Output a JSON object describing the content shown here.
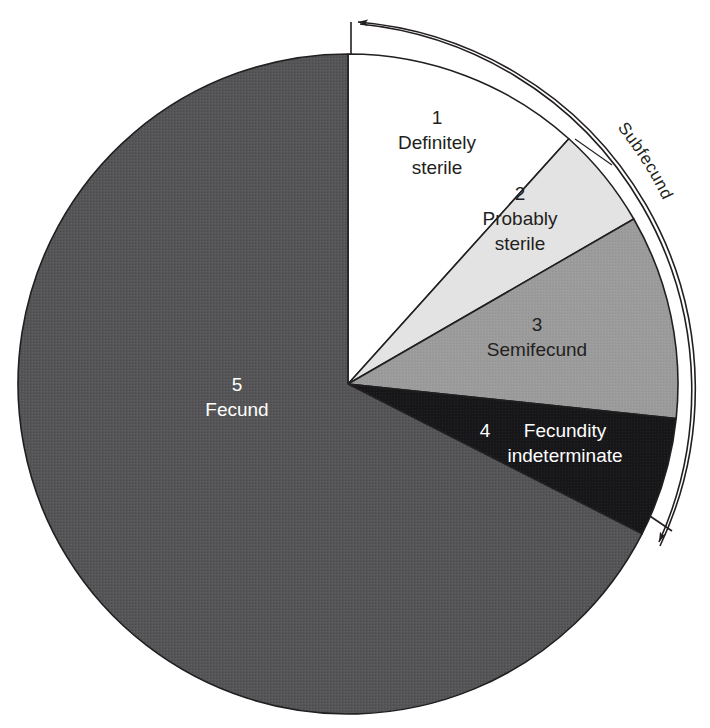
{
  "figure": {
    "type": "pie",
    "background": "#ffffff"
  },
  "bracket": {
    "label": "Subfecund",
    "start_angle_deg": 0,
    "end_angle_deg": 118,
    "start_arrow": "arrowhead-left",
    "end_arrow": "arrowhead-down"
  },
  "chart_data": {
    "type": "pie",
    "title": "",
    "subtitle": "",
    "xlabel": "",
    "ylabel": "",
    "grid": false,
    "legend": "none",
    "start_angle_deg": 0,
    "direction": "clockwise",
    "center": {
      "x": 348,
      "y": 384
    },
    "radius": 330,
    "annotations": [
      {
        "text": "Subfecund",
        "type": "arc-bracket",
        "covers": [
          "1",
          "2",
          "3",
          "4"
        ]
      }
    ],
    "categories": [
      "Definitely sterile",
      "Probably sterile",
      "Semifecund",
      "Fecundity indeterminate",
      "Fecund"
    ],
    "values": [
      11.7,
      5.0,
      10.0,
      5.8,
      67.5
    ],
    "units": "percent",
    "slices": [
      {
        "number": "1",
        "label_line1": "Definitely",
        "label_line2": "sterile",
        "value": 11.7,
        "start_deg": 0,
        "end_deg": 42,
        "fill": "#ffffff",
        "stroke": "#231f20",
        "text_color": "#231f20",
        "label_x": 437,
        "label_y": 124
      },
      {
        "number": "2",
        "label_line1": "Probably",
        "label_line2": "sterile",
        "value": 5.0,
        "start_deg": 42,
        "end_deg": 60,
        "fill": "#e3e3e3",
        "stroke": "#231f20",
        "text_color": "#231f20",
        "label_x": 520,
        "label_y": 200
      },
      {
        "number": "3",
        "label_line1": "Semifecund",
        "label_line2": "",
        "value": 10.0,
        "start_deg": 60,
        "end_deg": 96,
        "fill": "#9b9b9b",
        "stroke": "#231f20",
        "text_color": "#231f20",
        "label_x": 537,
        "label_y": 331
      },
      {
        "number": "4",
        "label_line1": "Fecundity",
        "label_line2": "indeterminate",
        "value": 5.8,
        "start_deg": 96,
        "end_deg": 117,
        "fill": "#17171a",
        "stroke": "#231f20",
        "text_color": "#ffffff",
        "label_x": 553,
        "label_y": 437
      },
      {
        "number": "5",
        "label_line1": "Fecund",
        "label_line2": "",
        "value": 67.5,
        "start_deg": 117,
        "end_deg": 360,
        "fill": "#555557",
        "stroke": "#231f20",
        "text_color": "#ffffff",
        "label_x": 237,
        "label_y": 391
      }
    ]
  }
}
